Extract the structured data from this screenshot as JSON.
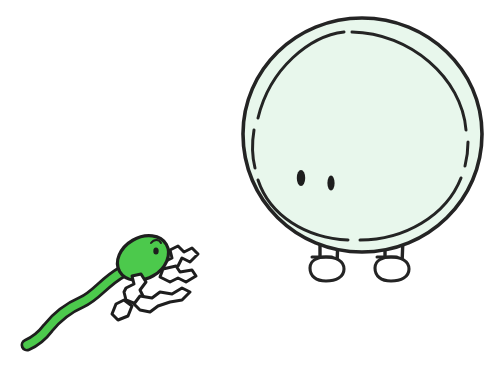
{
  "scene": {
    "title": "Cartoon sperm cell running toward an egg cell",
    "width": 503,
    "height": 368,
    "background_color": "#FFFFFF",
    "style": "hand-drawn marker illustration, black ink outline"
  },
  "palette": {
    "ink": "#1E1E1E",
    "sperm_green": "#4CC94C",
    "sperm_green_shade": "#3FB03F",
    "egg_fill": "#E8F7EC",
    "egg_outline": "#242424",
    "limb_fill": "#FFFFFF",
    "paper_white": "#FFFFFF"
  },
  "characters": [
    {
      "id": "sperm",
      "name": "sperm-cell",
      "label": "Sperm cell",
      "position": "lower-left",
      "fill_color": "#4CC94C",
      "outline_color": "#1E1E1E",
      "bounds": {
        "x": 22,
        "y": 232,
        "width": 182,
        "height": 118
      },
      "head": {
        "name": "sperm-head",
        "shape": "tilted oval",
        "center_x": 143,
        "center_y": 258,
        "radius_x": 26,
        "radius_y": 20,
        "rotation_deg": -28
      },
      "eye": {
        "name": "sperm-eye",
        "center_x": 156,
        "center_y": 250,
        "radius_x": 2.6,
        "radius_y": 3.4,
        "color": "#1E1E1E"
      },
      "eyebrow": {
        "name": "sperm-eyebrow",
        "description": "short curved brow arc above the eye"
      },
      "tail": {
        "name": "sperm-tail",
        "description": "long wavy S-curve flagellum tapering to a point toward the lower left",
        "stroke_width_start": 11,
        "stroke_width_end": 2
      },
      "limbs": {
        "name": "sperm-limbs",
        "pose": "running",
        "style": "thin black-outlined white tube stick limbs",
        "count": 4,
        "parts": [
          "front-arm",
          "back-arm",
          "front-leg",
          "back-leg"
        ]
      }
    },
    {
      "id": "egg",
      "name": "egg-cell",
      "label": "Egg cell (ovum)",
      "position": "right",
      "fill_color": "#E8F7EC",
      "outline_color": "#242424",
      "bounds": {
        "x": 243,
        "y": 18,
        "width": 240,
        "height": 272
      },
      "body": {
        "name": "egg-body",
        "shape": "double circle",
        "center_x": 362,
        "center_y": 135,
        "outer_radius": 118,
        "inner_radius": 104,
        "inner_ring_style": "broken / dashed hand-drawn arc",
        "outer_ring_label": "zona pellucida",
        "inner_ring_label": "cell membrane"
      },
      "eyes": [
        {
          "name": "egg-eye-left",
          "center_x": 301,
          "center_y": 178,
          "radius_x": 4.2,
          "radius_y": 8.0,
          "color": "#1E1E1E"
        },
        {
          "name": "egg-eye-right",
          "center_x": 331,
          "center_y": 183,
          "radius_x": 3.6,
          "radius_y": 7.4,
          "color": "#1E1E1E"
        }
      ],
      "legs": [
        {
          "name": "egg-leg-left",
          "shin_x_inner": 320,
          "shin_x_outer": 338,
          "top_y": 248,
          "foot_center_x": 325,
          "foot_center_y": 274,
          "foot_radius_x": 15,
          "foot_radius_y": 10
        },
        {
          "name": "egg-leg-right",
          "shin_x_inner": 385,
          "shin_x_outer": 403,
          "top_y": 248,
          "foot_center_x": 390,
          "foot_center_y": 274,
          "foot_radius_x": 15,
          "foot_radius_y": 10
        }
      ]
    }
  ]
}
